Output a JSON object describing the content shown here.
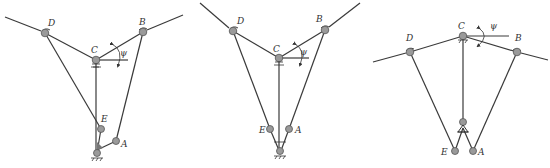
{
  "figure": {
    "panels": [
      {
        "id": "panel-1",
        "labels": {
          "D": "D",
          "B": "B",
          "C": "C",
          "E": "E",
          "A": "A",
          "angle": "ψ"
        },
        "points": {
          "D": [
            45,
            33
          ],
          "B": [
            143,
            32
          ],
          "C": [
            96,
            60
          ],
          "E": [
            101,
            129
          ],
          "A": [
            116,
            141
          ],
          "G": [
            97,
            153
          ],
          "L": [
            5,
            17
          ],
          "R": [
            183,
            15
          ]
        }
      },
      {
        "id": "panel-2",
        "labels": {
          "D": "D",
          "B": "B",
          "C": "C",
          "E": "E",
          "A": "A",
          "angle": "ψ"
        },
        "points": {
          "D": [
            233,
            31
          ],
          "B": [
            325,
            30
          ],
          "C": [
            279,
            58
          ],
          "E": [
            270,
            129
          ],
          "A": [
            289,
            129
          ],
          "G": [
            280,
            151
          ],
          "L": [
            200,
            3
          ],
          "R": [
            360,
            3
          ]
        }
      },
      {
        "id": "panel-3",
        "labels": {
          "D": "D",
          "B": "B",
          "C": "C",
          "E": "E",
          "A": "A",
          "angle": "ψ"
        },
        "points": {
          "D": [
            410,
            52
          ],
          "B": [
            517,
            52
          ],
          "C": [
            463,
            36
          ],
          "E": [
            455,
            151
          ],
          "A": [
            473,
            151
          ],
          "G": [
            463,
            122
          ],
          "L": [
            373,
            62
          ],
          "R": [
            548,
            60
          ]
        }
      }
    ],
    "colors": {
      "line": "#3a3a3a",
      "joint_fill": "#9a9a9a",
      "label": "#333333"
    }
  }
}
